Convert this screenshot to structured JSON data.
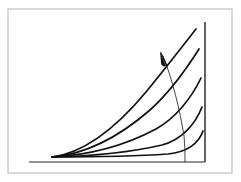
{
  "figure": {
    "title": "Family of exponential-type curves diverging from a common origin",
    "background_color": "#ffffff",
    "ink_color": "#111111",
    "axis_color": "#55595c",
    "border_color": "#c9c9c9",
    "canvas": {
      "width": 241,
      "height": 182
    }
  },
  "page_border": {
    "name": "page-border",
    "x": 8,
    "y": 9,
    "width": 224,
    "height": 164,
    "stroke": "#c9c9c9",
    "stroke_width": 1.4
  },
  "axes": {
    "horizontal": {
      "name": "x-axis",
      "label": "",
      "x1": 29,
      "y1": 162,
      "x2": 205,
      "y2": 162,
      "stroke": "#6b6f72",
      "stroke_width": 1.6
    },
    "vertical": {
      "name": "y-axis",
      "label": "",
      "x1": 205,
      "y1": 22,
      "x2": 205,
      "y2": 162,
      "stroke": "#2c2f31",
      "stroke_width": 1.5
    }
  },
  "chart_data": {
    "type": "line",
    "title": "Family of exponential-type curves diverging from a common origin",
    "xlabel": "",
    "ylabel": "",
    "xlim": [
      0,
      1
    ],
    "ylim": [
      0,
      1
    ],
    "grid": false,
    "legend": null,
    "origin_px": [
      52,
      157
    ],
    "series": [
      {
        "name": "curve-1-steepest",
        "order": 1,
        "steepness_rank": "highest",
        "end_point_px": [
          196,
          29
        ],
        "path": "M 52 157 C 84 153 116 128 146 92 C 164 70 182 47 196 29"
      },
      {
        "name": "curve-2",
        "order": 2,
        "steepness_rank": "high",
        "end_point_px": [
          199,
          49
        ],
        "path": "M 52 157 C 88 154 120 136 150 110 C 169 93 187 68 199 49"
      },
      {
        "name": "curve-3-middle",
        "order": 3,
        "steepness_rank": "medium",
        "end_point_px": [
          201,
          78
        ],
        "path": "M 52 157 C 92 155 126 145 156 129 C 176 118 192 97 201 78"
      },
      {
        "name": "curve-4",
        "order": 4,
        "steepness_rank": "low",
        "end_point_px": [
          202,
          107
        ],
        "path": "M 52 157 C 96 156 132 152 162 145 C 181 140 195 125 202 107"
      },
      {
        "name": "curve-5-flattest",
        "order": 5,
        "steepness_rank": "lowest",
        "end_point_px": [
          203,
          131
        ],
        "path": "M 52 157 C 100 157 140 156 168 154 C 187 152 198 145 203 131"
      }
    ],
    "annotations": [
      {
        "name": "sweep-arc",
        "kind": "arc",
        "description": "Thin arc crossing every curve from the arrowhead down to the baseline",
        "start_px": [
          163,
          56
        ],
        "end_px": [
          185,
          162
        ],
        "path": "M 163 56 C 172 78 180 110 184 136 C 185 147 185 156 185 162"
      },
      {
        "name": "direction-arrow",
        "kind": "arrow",
        "description": "Arrowhead on the arc pointing up and to the left toward steeper curves",
        "tip_px": [
          160,
          51
        ],
        "tail_px": [
          167,
          66
        ],
        "points_toward": "increasing steepness",
        "shaft_path": "M 167 66 L 161 53",
        "head_path": "M 160 51 L 166 66 L 163.6 66.4 L 161.2 64.6 Z"
      }
    ]
  }
}
